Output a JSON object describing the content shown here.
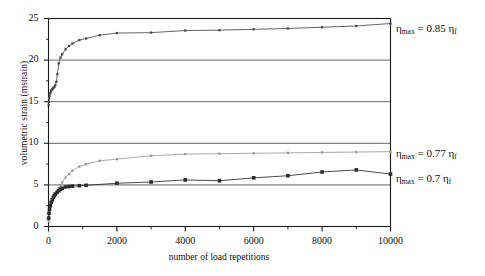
{
  "figure": {
    "background_color": "#ffffff",
    "frame_color": "#1a1a1a",
    "gridline_color": "#555555"
  },
  "axes": {
    "y_title": "volumetric strain (mstrain)",
    "x_title": "number of load repetitions",
    "y_ticks": [
      0,
      5,
      10,
      15,
      20,
      25
    ],
    "y_tick_labels": [
      "0",
      "5",
      "10",
      "15",
      "20",
      "25"
    ],
    "x_ticks": [
      0,
      2000,
      4000,
      6000,
      8000,
      10000
    ],
    "x_tick_labels": [
      "0",
      "2000",
      "4000",
      "6000",
      "8000",
      "10000"
    ],
    "x_minor_ticks": [
      1000,
      3000,
      5000,
      7000,
      9000
    ],
    "y_minor_ticks": [
      2.5,
      7.5,
      12.5,
      17.5,
      22.5
    ],
    "xlim": [
      0,
      10000
    ],
    "ylim": [
      0,
      25
    ],
    "grid": "horizontal"
  },
  "annotations": [
    {
      "id": "eta-085",
      "eta": "η",
      "sub": "max",
      "equals": " = 0.85 ",
      "eta_f": "η",
      "sub_f": "f",
      "full_text": "ηmax = 0.85 ηf"
    },
    {
      "id": "eta-077",
      "eta": "η",
      "sub": "max",
      "equals": " = 0.77 ",
      "eta_f": "η",
      "sub_f": "f",
      "full_text": "ηmax = 0.77 ηf"
    },
    {
      "id": "eta-07",
      "eta": "η",
      "sub": "max",
      "equals": " = 0.7 ",
      "eta_f": "η",
      "sub_f": "f",
      "full_text": "ηmax = 0.7 ηf"
    }
  ],
  "chart_data": {
    "type": "line",
    "title": "",
    "xlabel": "number of load repetitions",
    "ylabel": "volumetric strain (mstrain)",
    "xlim": [
      0,
      10000
    ],
    "ylim": [
      0,
      25
    ],
    "grid": true,
    "legend_position": "right-inline-annotations",
    "series": [
      {
        "name": "ηmax = 0.85 ηf",
        "color": "#4a4a4a",
        "marker": "square-small",
        "x": [
          5,
          10,
          20,
          30,
          50,
          70,
          90,
          110,
          130,
          150,
          175,
          200,
          230,
          260,
          300,
          350,
          400,
          500,
          600,
          700,
          900,
          1100,
          1500,
          2000,
          3000,
          4000,
          5000,
          6000,
          7000,
          8000,
          9000,
          10000
        ],
        "y": [
          14.6,
          15.0,
          15.4,
          15.7,
          16.0,
          16.2,
          16.4,
          16.5,
          16.6,
          16.7,
          16.8,
          17.0,
          17.4,
          18.3,
          19.6,
          20.3,
          20.7,
          21.3,
          21.7,
          22.0,
          22.4,
          22.6,
          23.0,
          23.25,
          23.3,
          23.55,
          23.6,
          23.7,
          23.8,
          23.95,
          24.1,
          24.4
        ]
      },
      {
        "name": "ηmax = 0.77 ηf",
        "color": "#9a9a9a",
        "marker": "square-small",
        "x": [
          5,
          15,
          30,
          50,
          80,
          110,
          140,
          170,
          200,
          250,
          300,
          350,
          400,
          500,
          600,
          700,
          900,
          1100,
          1500,
          2000,
          3000,
          4000,
          5000,
          6000,
          7000,
          8000,
          9000,
          10000
        ],
        "y": [
          0.6,
          1.2,
          1.8,
          2.3,
          2.8,
          3.2,
          3.5,
          3.8,
          4.0,
          4.3,
          4.6,
          4.9,
          5.3,
          5.9,
          6.3,
          6.7,
          7.2,
          7.5,
          7.9,
          8.1,
          8.5,
          8.7,
          8.75,
          8.8,
          8.85,
          8.9,
          8.95,
          9.0
        ]
      },
      {
        "name": "ηmax = 0.7 ηf",
        "color": "#2b2b2b",
        "marker": "square-large",
        "x": [
          5,
          15,
          30,
          50,
          80,
          110,
          140,
          170,
          200,
          250,
          300,
          350,
          400,
          500,
          600,
          700,
          900,
          1100,
          2000,
          3000,
          4000,
          5000,
          6000,
          7000,
          8000,
          9000,
          10000
        ],
        "y": [
          1.0,
          1.6,
          2.1,
          2.5,
          2.9,
          3.2,
          3.5,
          3.7,
          3.9,
          4.1,
          4.3,
          4.45,
          4.6,
          4.75,
          4.8,
          4.85,
          4.9,
          4.95,
          5.2,
          5.35,
          5.6,
          5.5,
          5.85,
          6.1,
          6.55,
          6.8,
          6.3
        ]
      }
    ]
  }
}
